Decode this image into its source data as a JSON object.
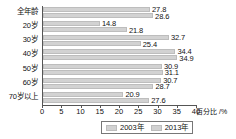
{
  "chart_data": {
    "type": "bar",
    "orientation": "horizontal",
    "title": "",
    "xlabel": "百分比 /%",
    "ylabel": "",
    "xlim": [
      0,
      40
    ],
    "xticks": [
      0,
      5,
      10,
      15,
      20,
      25,
      30,
      35,
      40
    ],
    "grid": false,
    "legend_position": "bottom",
    "categories": [
      "全年龄",
      "20岁",
      "30岁",
      "40岁",
      "50岁",
      "60岁",
      "70岁以上"
    ],
    "series": [
      {
        "name": "2003年",
        "color": "#d2d2d2",
        "values": [
          27.8,
          14.8,
          32.7,
          34.4,
          30.9,
          30.7,
          20.9
        ]
      },
      {
        "name": "2013年",
        "color": "#d2d2d2",
        "values": [
          28.6,
          21.8,
          25.4,
          34.9,
          31.1,
          28.7,
          27.6
        ]
      }
    ]
  }
}
